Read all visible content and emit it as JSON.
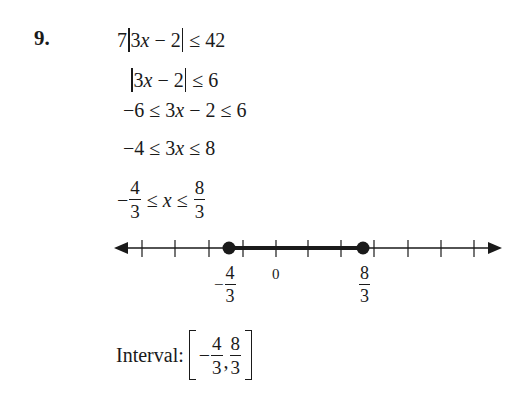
{
  "problem": {
    "number": "9.",
    "steps": [
      {
        "coef": "7",
        "inner": "3x − 2",
        "rhs": "≤ 42"
      },
      {
        "inner": "3x − 2",
        "rhs": "≤ 6"
      },
      {
        "text_a": "−6 ≤ 3",
        "var": "x",
        "text_b": " − 2 ≤ 6"
      },
      {
        "text_a": "−4 ≤ 3",
        "var": "x",
        "text_b": " ≤ 8"
      },
      {
        "neg": "−",
        "num1": "4",
        "den1": "3",
        "mid_a": " ≤ ",
        "var": "x",
        "mid_b": " ≤ ",
        "num2": "8",
        "den2": "3"
      }
    ]
  },
  "number_line": {
    "tick_labels": {
      "left_neg": "−",
      "left_num": "4",
      "left_den": "3",
      "zero": "0",
      "right_num": "8",
      "right_den": "3"
    },
    "closed_endpoints": [
      "-4/3",
      "8/3"
    ],
    "shaded_interval": "[-4/3, 8/3]",
    "tick_count": 11
  },
  "interval": {
    "label": "Interval:",
    "neg": "−",
    "num1": "4",
    "den1": "3",
    "comma": ",",
    "num2": "8",
    "den2": "3"
  }
}
